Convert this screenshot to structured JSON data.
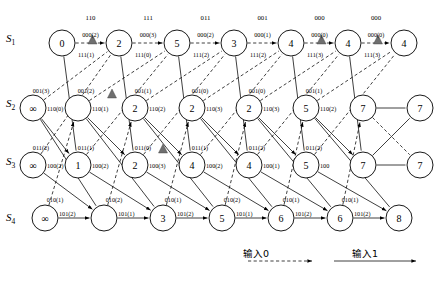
{
  "figure": {
    "type": "trellis-diagram",
    "title_visible": false,
    "columns": 8,
    "rows": 4,
    "row_labels": [
      "S",
      "S",
      "S",
      "S"
    ],
    "row_label_subs": [
      "1",
      "2",
      "3",
      "4"
    ]
  },
  "legend": {
    "input0_label": "输入0",
    "input1_label": "输入1",
    "input0_style": "dashed-arrow",
    "input1_style": "solid-arrow"
  },
  "colors": {
    "line": "#000000",
    "node_fill": "#ffffff",
    "marker": "#6f6f6f",
    "background": "#ffffff"
  },
  "chart_data": {
    "type": "diagram",
    "stage_top_labels": [
      "110",
      "111",
      "011",
      "001",
      "000",
      "000"
    ],
    "nodes": [
      {
        "row": 1,
        "col": 0,
        "value": "0"
      },
      {
        "row": 1,
        "col": 1,
        "value": "2"
      },
      {
        "row": 1,
        "col": 2,
        "value": "5"
      },
      {
        "row": 1,
        "col": 3,
        "value": "3"
      },
      {
        "row": 1,
        "col": 4,
        "value": "4"
      },
      {
        "row": 1,
        "col": 5,
        "value": "4"
      },
      {
        "row": 1,
        "col": 6,
        "value": "4"
      },
      {
        "row": 2,
        "col": 0,
        "value": "∞"
      },
      {
        "row": 2,
        "col": 1,
        "value": ""
      },
      {
        "row": 2,
        "col": 2,
        "value": "2"
      },
      {
        "row": 2,
        "col": 3,
        "value": "2"
      },
      {
        "row": 2,
        "col": 4,
        "value": "2"
      },
      {
        "row": 2,
        "col": 5,
        "value": "5"
      },
      {
        "row": 2,
        "col": 6,
        "value": "7"
      },
      {
        "row": 2,
        "col": 7,
        "value": "7"
      },
      {
        "row": 3,
        "col": 0,
        "value": "∞"
      },
      {
        "row": 3,
        "col": 1,
        "value": "1"
      },
      {
        "row": 3,
        "col": 2,
        "value": "2"
      },
      {
        "row": 3,
        "col": 3,
        "value": "4"
      },
      {
        "row": 3,
        "col": 4,
        "value": "4"
      },
      {
        "row": 3,
        "col": 5,
        "value": "5"
      },
      {
        "row": 3,
        "col": 6,
        "value": "7"
      },
      {
        "row": 3,
        "col": 7,
        "value": "7"
      },
      {
        "row": 4,
        "col": 0,
        "value": "∞"
      },
      {
        "row": 4,
        "col": 1,
        "value": ""
      },
      {
        "row": 4,
        "col": 2,
        "value": "3"
      },
      {
        "row": 4,
        "col": 3,
        "value": "5"
      },
      {
        "row": 4,
        "col": 4,
        "value": "6"
      },
      {
        "row": 4,
        "col": 5,
        "value": "6"
      },
      {
        "row": 4,
        "col": 6,
        "value": "8"
      }
    ],
    "row1_upper_labels": [
      "000(2)",
      "000(3)",
      "000(2)",
      "000(1)",
      "000(0)",
      "000(0)"
    ],
    "row1_lower_labels": [
      "111(1)",
      "111(0)",
      "111(2)",
      "111(2)",
      "111(3)",
      "111(3)"
    ],
    "row2_upper_labels": [
      "001(3)",
      "001(2)",
      "001(1)",
      "001(0)",
      "001(0)",
      "001(1)"
    ],
    "row2_lower_labels": [
      "110(0)",
      "110(1)",
      "110(2)",
      "110(3)",
      "110(3)",
      "110(2)"
    ],
    "row3_upper_labels": [
      "011(2)",
      "011(1)",
      "011(0)",
      "011(1)",
      "011(2)",
      "011(2)"
    ],
    "row3_lower_labels": [
      "100(2)",
      "100(2)",
      "100(3)",
      "100(2)",
      "100(1)",
      "100"
    ],
    "row4_upper_labels": [
      "010(1)",
      "010(2)",
      "010(1)",
      "010(2)",
      "010(1)",
      "010(1)"
    ],
    "row4_lower_labels": [
      "101(2)",
      "101(1)",
      "101(2)",
      "101(1)",
      "101(2)",
      "101(2)"
    ],
    "survivor_markers": [
      {
        "row": 1,
        "after_col": 0
      },
      {
        "row": 1,
        "after_col": 4
      },
      {
        "row": 1,
        "after_col": 5
      },
      {
        "row": 2,
        "after_col": 1
      },
      {
        "row": 3,
        "after_col": 2
      }
    ]
  }
}
